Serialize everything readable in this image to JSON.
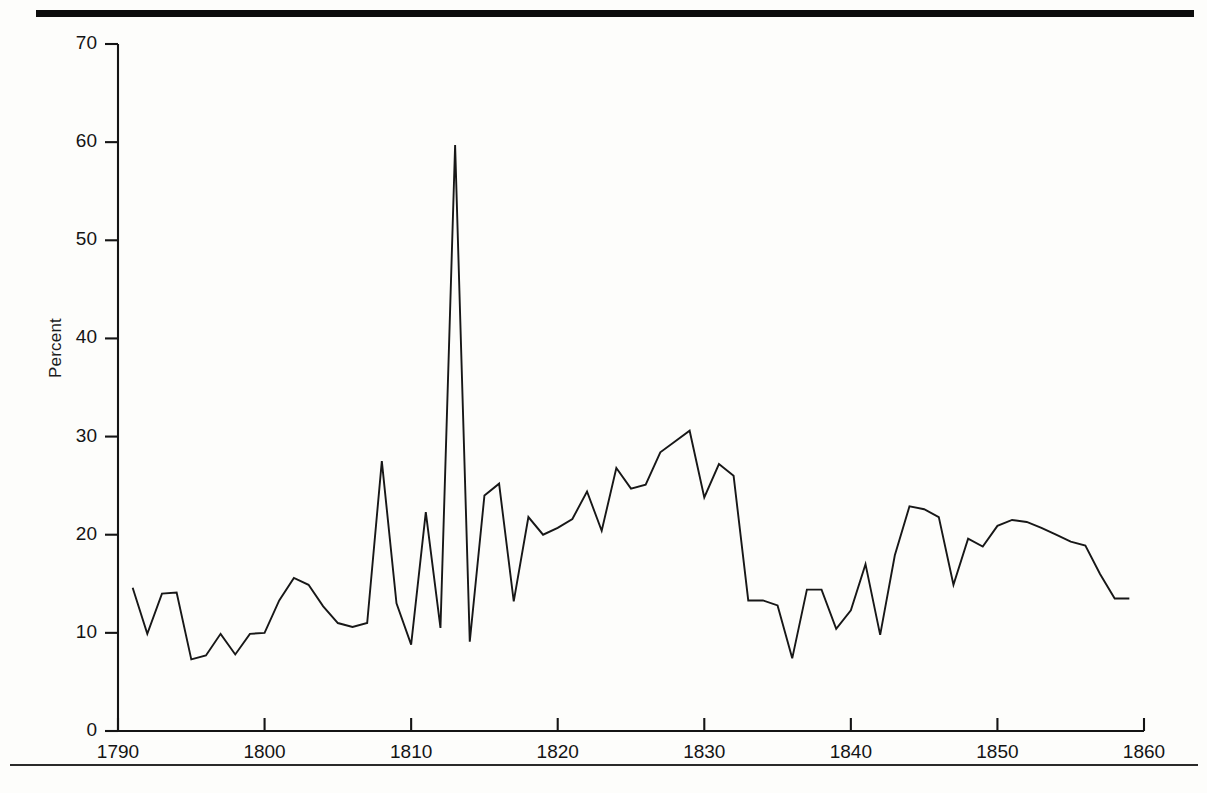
{
  "figure": {
    "y_axis_label": "Percent",
    "y_ticks": [
      "0",
      "10",
      "20",
      "30",
      "40",
      "50",
      "60",
      "70"
    ],
    "x_ticks": [
      "1790",
      "1800",
      "1810",
      "1820",
      "1830",
      "1840",
      "1850",
      "1860"
    ],
    "line_color": "#171717",
    "axis_color": "#141414",
    "rule_color": "#0d0d0d"
  },
  "chart_data": {
    "type": "line",
    "title": "",
    "xlabel": "",
    "ylabel": "Percent",
    "xlim": [
      1790,
      1860
    ],
    "ylim": [
      0,
      70
    ],
    "grid": false,
    "legend": false,
    "x_tick_values": [
      1790,
      1800,
      1810,
      1820,
      1830,
      1840,
      1850,
      1860
    ],
    "y_tick_values": [
      0,
      10,
      20,
      30,
      40,
      50,
      60,
      70
    ],
    "series": [
      {
        "name": "Percent",
        "x": [
          1791,
          1792,
          1793,
          1794,
          1795,
          1796,
          1797,
          1798,
          1799,
          1800,
          1801,
          1802,
          1803,
          1804,
          1805,
          1806,
          1807,
          1808,
          1809,
          1810,
          1811,
          1812,
          1813,
          1814,
          1815,
          1816,
          1817,
          1818,
          1819,
          1820,
          1821,
          1822,
          1823,
          1824,
          1825,
          1826,
          1827,
          1828,
          1829,
          1830,
          1831,
          1832,
          1833,
          1834,
          1835,
          1836,
          1837,
          1838,
          1839,
          1840,
          1841,
          1842,
          1843,
          1844,
          1845,
          1846,
          1847,
          1848,
          1849,
          1850,
          1851,
          1852,
          1853,
          1854,
          1855,
          1856,
          1857,
          1858,
          1859
        ],
        "values": [
          14.6,
          9.9,
          14.0,
          14.1,
          7.3,
          7.7,
          9.9,
          7.8,
          9.9,
          10.0,
          13.3,
          15.6,
          14.9,
          12.7,
          11.0,
          10.6,
          11.0,
          27.5,
          13.0,
          8.8,
          22.3,
          10.5,
          59.7,
          9.1,
          24.0,
          25.2,
          13.2,
          21.8,
          20.0,
          20.7,
          21.6,
          24.4,
          20.4,
          26.8,
          24.7,
          25.1,
          28.4,
          29.5,
          30.6,
          23.8,
          27.2,
          26.0,
          13.3,
          13.3,
          12.8,
          7.4,
          14.4,
          14.4,
          10.4,
          12.3,
          17.0,
          9.8,
          17.9,
          22.9,
          22.6,
          21.8,
          14.9,
          19.6,
          18.8,
          20.9,
          21.5,
          21.3,
          20.7,
          20.0,
          19.3,
          18.9,
          16.0,
          13.5,
          13.5
        ]
      }
    ]
  }
}
